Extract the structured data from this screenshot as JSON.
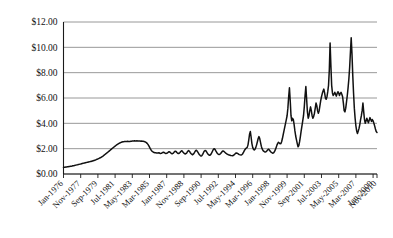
{
  "chart_data": {
    "type": "line",
    "title": "",
    "subtitle": "",
    "xlabel": "",
    "ylabel": "",
    "ylim": [
      0,
      12
    ],
    "yticks": [
      0,
      2,
      4,
      6,
      8,
      10,
      12
    ],
    "ytick_labels": [
      "$0.00",
      "$2.00",
      "$4.00",
      "$6.00",
      "$8.00",
      "$10.00",
      "$12.00"
    ],
    "grid": "horizontal",
    "legend": "none",
    "xtick_labels": [
      "Jan-1976",
      "Nov-1977",
      "Sep-1979",
      "Jul-1981",
      "May-1983",
      "Mar-1985",
      "Jan-1987",
      "Nov-1988",
      "Sep-1990",
      "Jul-1992",
      "May-1994",
      "Mar-1996",
      "Jan-1998",
      "Nov-1999",
      "Sep-2001",
      "Jul-2003",
      "May-2005",
      "Mar-2007",
      "Jan-2009",
      "Nov-2010"
    ],
    "x_start": "Jan-1976",
    "x_end": "Nov-2010",
    "x_interval_months": 1,
    "xtick_interval_months": 22,
    "series": [
      {
        "name": "Price",
        "color": "#111111",
        "values": [
          0.52,
          0.53,
          0.54,
          0.55,
          0.56,
          0.57,
          0.58,
          0.59,
          0.6,
          0.61,
          0.62,
          0.63,
          0.65,
          0.66,
          0.67,
          0.69,
          0.7,
          0.72,
          0.73,
          0.75,
          0.76,
          0.78,
          0.79,
          0.81,
          0.83,
          0.84,
          0.86,
          0.87,
          0.89,
          0.9,
          0.92,
          0.93,
          0.95,
          0.96,
          0.98,
          0.99,
          1.01,
          1.03,
          1.05,
          1.07,
          1.09,
          1.11,
          1.14,
          1.16,
          1.19,
          1.22,
          1.25,
          1.28,
          1.32,
          1.36,
          1.4,
          1.44,
          1.49,
          1.54,
          1.59,
          1.64,
          1.69,
          1.74,
          1.79,
          1.84,
          1.9,
          1.95,
          2.0,
          2.05,
          2.1,
          2.15,
          2.2,
          2.25,
          2.3,
          2.34,
          2.38,
          2.42,
          2.45,
          2.48,
          2.5,
          2.52,
          2.54,
          2.55,
          2.56,
          2.57,
          2.56,
          2.57,
          2.58,
          2.57,
          2.56,
          2.57,
          2.58,
          2.59,
          2.6,
          2.61,
          2.6,
          2.62,
          2.61,
          2.6,
          2.62,
          2.61,
          2.6,
          2.61,
          2.6,
          2.59,
          2.6,
          2.59,
          2.58,
          2.57,
          2.55,
          2.52,
          2.48,
          2.42,
          2.34,
          2.24,
          2.12,
          2.0,
          1.9,
          1.82,
          1.76,
          1.72,
          1.7,
          1.68,
          1.67,
          1.66,
          1.65,
          1.66,
          1.68,
          1.64,
          1.62,
          1.63,
          1.66,
          1.7,
          1.72,
          1.68,
          1.64,
          1.62,
          1.63,
          1.67,
          1.72,
          1.76,
          1.74,
          1.68,
          1.62,
          1.6,
          1.63,
          1.69,
          1.76,
          1.8,
          1.78,
          1.7,
          1.64,
          1.61,
          1.64,
          1.7,
          1.78,
          1.84,
          1.8,
          1.72,
          1.65,
          1.6,
          1.58,
          1.62,
          1.7,
          1.8,
          1.86,
          1.8,
          1.7,
          1.62,
          1.56,
          1.52,
          1.56,
          1.64,
          1.74,
          1.84,
          1.88,
          1.8,
          1.7,
          1.6,
          1.52,
          1.46,
          1.42,
          1.46,
          1.55,
          1.68,
          1.8,
          1.86,
          1.84,
          1.74,
          1.64,
          1.56,
          1.5,
          1.48,
          1.52,
          1.6,
          1.72,
          1.86,
          1.96,
          2.0,
          1.92,
          1.8,
          1.7,
          1.62,
          1.56,
          1.54,
          1.56,
          1.62,
          1.7,
          1.78,
          1.82,
          1.8,
          1.74,
          1.68,
          1.62,
          1.58,
          1.55,
          1.52,
          1.5,
          1.48,
          1.46,
          1.45,
          1.44,
          1.46,
          1.5,
          1.56,
          1.62,
          1.66,
          1.64,
          1.6,
          1.56,
          1.53,
          1.51,
          1.5,
          1.52,
          1.58,
          1.68,
          1.8,
          1.92,
          2.0,
          2.05,
          2.1,
          2.3,
          2.7,
          3.15,
          3.35,
          2.9,
          2.4,
          2.1,
          1.95,
          1.9,
          1.96,
          2.1,
          2.3,
          2.55,
          2.8,
          2.95,
          2.8,
          2.5,
          2.2,
          2.0,
          1.88,
          1.8,
          1.76,
          1.74,
          1.76,
          1.82,
          1.9,
          1.96,
          1.92,
          1.84,
          1.76,
          1.7,
          1.66,
          1.64,
          1.68,
          1.78,
          1.92,
          2.1,
          2.28,
          2.42,
          2.5,
          2.45,
          2.38,
          2.4,
          2.55,
          2.8,
          3.1,
          3.4,
          3.7,
          4.0,
          4.3,
          4.6,
          5.2,
          6.1,
          6.8,
          5.8,
          4.6,
          4.2,
          4.4,
          4.3,
          3.9,
          3.4,
          3.0,
          2.7,
          2.4,
          2.15,
          2.25,
          2.55,
          2.95,
          3.4,
          3.8,
          4.2,
          4.6,
          5.3,
          6.2,
          6.9,
          5.9,
          4.9,
          4.4,
          4.6,
          5.0,
          5.3,
          5.0,
          4.6,
          4.4,
          4.55,
          4.8,
          5.2,
          5.6,
          5.4,
          5.0,
          4.8,
          5.0,
          5.4,
          5.8,
          6.1,
          6.35,
          6.55,
          6.7,
          6.4,
          6.0,
          5.9,
          6.1,
          6.5,
          7.0,
          8.2,
          10.35,
          8.6,
          7.0,
          6.4,
          6.2,
          6.3,
          6.45,
          6.3,
          6.15,
          6.35,
          6.5,
          6.4,
          6.2,
          6.35,
          6.45,
          6.3,
          6.1,
          5.6,
          5.0,
          4.9,
          5.2,
          5.7,
          6.2,
          6.8,
          7.5,
          8.4,
          9.6,
          10.75,
          9.5,
          7.8,
          6.4,
          5.2,
          4.4,
          3.8,
          3.4,
          3.2,
          3.4,
          3.6,
          3.9,
          4.3,
          4.6,
          5.0,
          5.6,
          4.9,
          4.3,
          4.0,
          4.2,
          4.4,
          4.2,
          4.05,
          4.25,
          4.45,
          4.3,
          4.15,
          4.3,
          4.2,
          4.0,
          3.8,
          3.55,
          3.35,
          3.28
        ]
      }
    ]
  }
}
